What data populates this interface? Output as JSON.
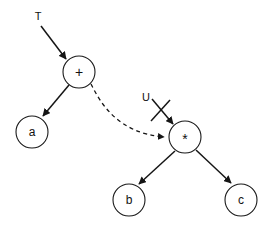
{
  "diagram": {
    "type": "expression-tree-rewrite",
    "background_color": "#ffffff",
    "stroke_color": "#151515",
    "nodes": [
      {
        "id": "plus",
        "label": "+",
        "cx": 79,
        "cy": 72,
        "r": 16
      },
      {
        "id": "a",
        "label": "a",
        "cx": 32,
        "cy": 132,
        "r": 16
      },
      {
        "id": "times",
        "label": "*",
        "cx": 185,
        "cy": 137,
        "r": 16
      },
      {
        "id": "b",
        "label": "b",
        "cx": 129,
        "cy": 200,
        "r": 16
      },
      {
        "id": "c",
        "label": "c",
        "cx": 241,
        "cy": 200,
        "r": 16
      }
    ],
    "edges": [
      {
        "id": "plus-to-a",
        "from": "plus",
        "to": "a",
        "style": "solid",
        "arrow": true
      },
      {
        "id": "times-to-b",
        "from": "times",
        "to": "b",
        "style": "solid",
        "arrow": true
      },
      {
        "id": "times-to-c",
        "from": "times",
        "to": "c",
        "style": "solid",
        "arrow": true
      },
      {
        "id": "plus-to-times",
        "from": "plus",
        "to": "times",
        "style": "dashed",
        "arrow": true
      }
    ],
    "annotations": [
      {
        "id": "pointer-t",
        "label": "T",
        "label_x": 38,
        "label_y": 16,
        "crossed_out": false
      },
      {
        "id": "pointer-u",
        "label": "U",
        "label_x": 146,
        "label_y": 97,
        "crossed_out": true
      }
    ]
  }
}
